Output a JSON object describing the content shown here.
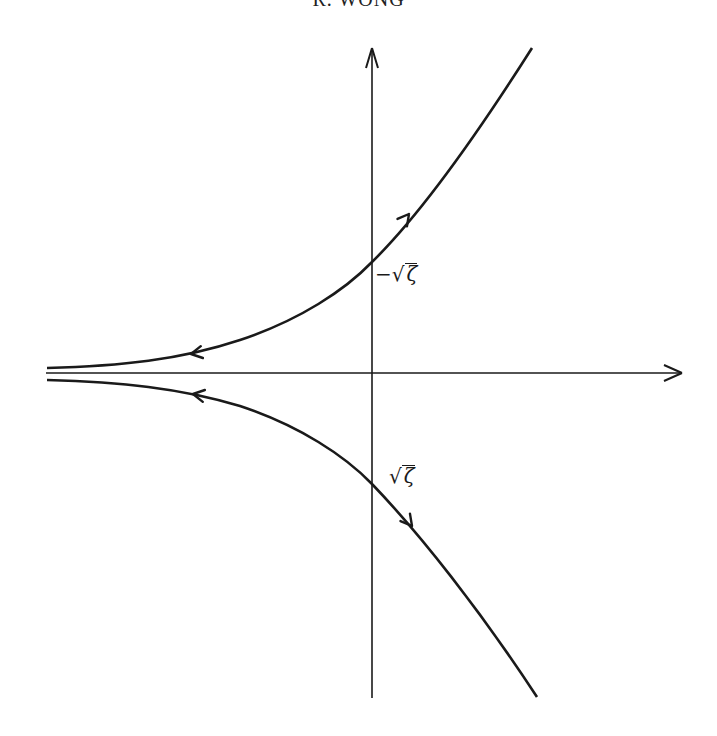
{
  "header": {
    "running_head": "R. WONG"
  },
  "figure": {
    "type": "contour-diagram",
    "axes": {
      "horizontal": "real axis (arrow right)",
      "vertical": "imaginary axis (arrow up)"
    },
    "labels": {
      "upper_intercept": {
        "prefix": "−",
        "radical": "√",
        "radicand": "ζ"
      },
      "lower_intercept": {
        "prefix": "",
        "radical": "√",
        "radicand": "ζ"
      }
    },
    "curves": [
      {
        "name": "upper-branch",
        "direction_arrows": [
          "toward upper right",
          "toward left"
        ]
      },
      {
        "name": "lower-branch",
        "direction_arrows": [
          "toward lower right",
          "toward left"
        ]
      }
    ],
    "stroke_color": "#1a1a1a"
  }
}
